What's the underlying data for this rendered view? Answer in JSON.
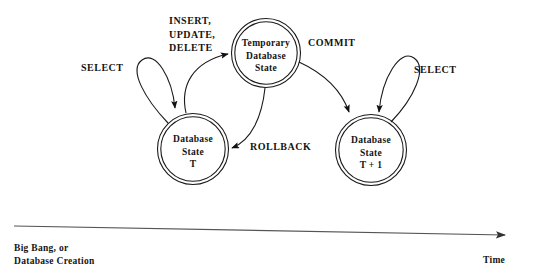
{
  "diagram": {
    "type": "state-diagram",
    "stroke_color": "#1a1a1a",
    "axis_color": "#555555",
    "background_color": "#ffffff",
    "nodes": [
      {
        "id": "state_t",
        "shape": "double-circle",
        "cx": 193,
        "cy": 149,
        "r": 35,
        "lines": [
          "Database",
          "State",
          "T"
        ],
        "line1": "Database",
        "line2": "State",
        "line3": "T"
      },
      {
        "id": "temp_state",
        "shape": "double-circle",
        "cx": 266,
        "cy": 53,
        "r": 34,
        "lines": [
          "Temporary",
          "Database",
          "State"
        ],
        "line1": "Temporary",
        "line2": "Database",
        "line3": "State"
      },
      {
        "id": "state_t_plus_1",
        "shape": "double-circle",
        "cx": 371,
        "cy": 150,
        "r": 35,
        "lines": [
          "Database",
          "State",
          "T + 1"
        ],
        "line1": "Database",
        "line2": "State",
        "line3": "T + 1"
      }
    ],
    "edges": [
      {
        "id": "select_left",
        "from": "state_t",
        "to": "state_t",
        "kind": "self-loop",
        "label": "SELECT"
      },
      {
        "id": "dml",
        "from": "state_t",
        "to": "temp_state",
        "kind": "curve",
        "label_line1": "INSERT,",
        "label_line2": "UPDATE,",
        "label_line3": "DELETE"
      },
      {
        "id": "commit",
        "from": "temp_state",
        "to": "state_t_plus_1",
        "kind": "curve",
        "label": "COMMIT"
      },
      {
        "id": "rollback",
        "from": "temp_state",
        "to": "state_t",
        "kind": "curve",
        "label": "ROLLBACK"
      },
      {
        "id": "select_right",
        "from": "state_t_plus_1",
        "to": "state_t_plus_1",
        "kind": "self-loop",
        "label": "SELECT"
      }
    ],
    "timeline": {
      "axis_name": "time-axis-arrow",
      "origin_line1": "Big Bang, or",
      "origin_line2": "Database Creation",
      "end_label": "Time"
    }
  }
}
